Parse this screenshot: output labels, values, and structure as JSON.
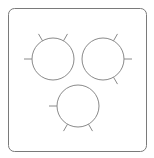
{
  "colors": {
    "frame": "#7a7a7a",
    "stroke": "#8a8a8a",
    "background": "#ffffff"
  },
  "circles": [
    {
      "name": "circle-top-left",
      "ticks_deg": [
        180,
        -120,
        -60
      ]
    },
    {
      "name": "circle-top-right",
      "ticks_deg": [
        -60,
        0,
        60
      ]
    },
    {
      "name": "circle-bottom",
      "ticks_deg": [
        180,
        120,
        60
      ]
    }
  ]
}
